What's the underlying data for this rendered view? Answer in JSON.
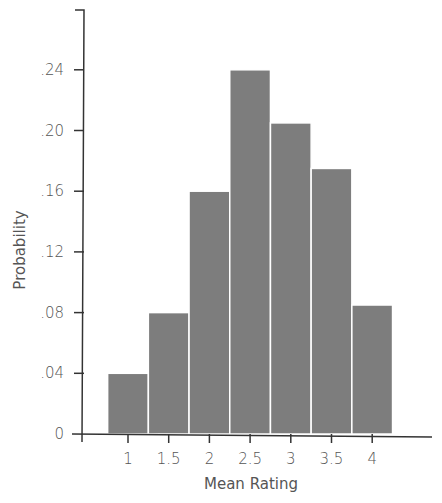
{
  "chart_data": {
    "type": "bar",
    "title": "",
    "xlabel": "Mean Rating",
    "ylabel": "Probability",
    "categories": [
      "1",
      "1.5",
      "2",
      "2.5",
      "3",
      "3.5",
      "4"
    ],
    "values": [
      0.04,
      0.08,
      0.16,
      0.24,
      0.205,
      0.175,
      0.085
    ],
    "x_ticks": [
      "1",
      "1.5",
      "2",
      "2.5",
      "3",
      "3.5",
      "4"
    ],
    "y_ticks": [
      "0",
      ".04",
      ".08",
      ".12",
      ".16",
      ".20",
      ".24"
    ],
    "y_tick_values": [
      0,
      0.04,
      0.08,
      0.12,
      0.16,
      0.2,
      0.24
    ],
    "ylim": [
      0,
      0.27
    ],
    "grid": false,
    "legend": null,
    "bar_color": "#7d7d7d"
  }
}
